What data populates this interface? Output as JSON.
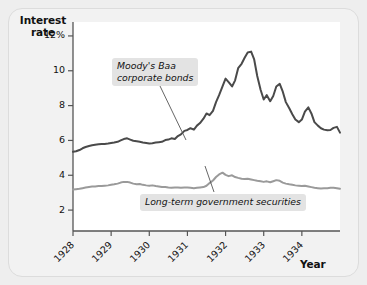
{
  "figure": {
    "background_color": "#f2f2f2",
    "plot_background_color": "#ffffff"
  },
  "axes": {
    "y_title_line1": "Interest",
    "y_title_line2": "rate",
    "x_title": "Year",
    "y_ticks": [
      "12%",
      "10",
      "8",
      "6",
      "4",
      "2"
    ],
    "y_tick_values": [
      12,
      10,
      8,
      6,
      4,
      2
    ],
    "x_ticks": [
      "1928",
      "1929",
      "1930",
      "1931",
      "1932",
      "1933",
      "1934"
    ]
  },
  "annotations": {
    "baa_label_line1": "Moody's Baa",
    "baa_label_line2": "corporate bonds",
    "govt_label": "Long-term government securities"
  },
  "chart_data": {
    "type": "line",
    "title": "",
    "subtitle": "",
    "xlabel": "Year",
    "ylabel": "Interest rate",
    "xlim": [
      1928.0,
      1935.0
    ],
    "ylim": [
      0.8,
      12.8
    ],
    "ytick_values": [
      2,
      4,
      6,
      8,
      10,
      12
    ],
    "ytick_labels": [
      "2",
      "4",
      "6",
      "8",
      "10",
      "12%"
    ],
    "xtick_values": [
      1928,
      1929,
      1930,
      1931,
      1932,
      1933,
      1934
    ],
    "xtick_labels": [
      "1928",
      "1929",
      "1930",
      "1931",
      "1932",
      "1933",
      "1934"
    ],
    "grid": false,
    "legend": "annotations-inline",
    "series": [
      {
        "name": "Moody's Baa corporate bonds",
        "color": "#4a4a4a",
        "linewidth": 2.0,
        "x": [
          1928.0,
          1928.08,
          1928.17,
          1928.25,
          1928.33,
          1928.42,
          1928.5,
          1928.58,
          1928.67,
          1928.75,
          1928.83,
          1928.92,
          1929.0,
          1929.08,
          1929.17,
          1929.25,
          1929.33,
          1929.42,
          1929.5,
          1929.58,
          1929.67,
          1929.75,
          1929.83,
          1929.92,
          1930.0,
          1930.08,
          1930.17,
          1930.25,
          1930.33,
          1930.42,
          1930.5,
          1930.58,
          1930.67,
          1930.75,
          1930.83,
          1930.92,
          1931.0,
          1931.08,
          1931.17,
          1931.25,
          1931.33,
          1931.42,
          1931.5,
          1931.58,
          1931.67,
          1931.75,
          1931.83,
          1931.92,
          1932.0,
          1932.08,
          1932.17,
          1932.25,
          1932.33,
          1932.42,
          1932.5,
          1932.58,
          1932.67,
          1932.75,
          1932.83,
          1932.92,
          1933.0,
          1933.08,
          1933.17,
          1933.25,
          1933.33,
          1933.42,
          1933.5,
          1933.58,
          1933.67,
          1933.75,
          1933.83,
          1933.92,
          1934.0,
          1934.08,
          1934.17,
          1934.25,
          1934.33,
          1934.42,
          1934.5,
          1934.58,
          1934.67,
          1934.75,
          1934.83,
          1934.92,
          1935.0
        ],
        "y": [
          5.35,
          5.38,
          5.45,
          5.55,
          5.62,
          5.68,
          5.72,
          5.75,
          5.78,
          5.8,
          5.8,
          5.82,
          5.85,
          5.88,
          5.92,
          6.0,
          6.08,
          6.12,
          6.05,
          5.98,
          5.95,
          5.92,
          5.88,
          5.85,
          5.82,
          5.84,
          5.88,
          5.9,
          5.92,
          6.02,
          6.05,
          6.12,
          6.08,
          6.25,
          6.35,
          6.55,
          6.6,
          6.7,
          6.62,
          6.85,
          7.0,
          7.25,
          7.55,
          7.45,
          7.7,
          8.2,
          8.6,
          9.1,
          9.55,
          9.35,
          9.1,
          9.45,
          10.15,
          10.4,
          10.75,
          11.05,
          11.1,
          10.65,
          9.7,
          8.9,
          8.35,
          8.6,
          8.25,
          8.55,
          9.1,
          9.25,
          8.8,
          8.2,
          7.85,
          7.5,
          7.2,
          7.05,
          7.2,
          7.65,
          7.9,
          7.55,
          7.05,
          6.85,
          6.7,
          6.62,
          6.58,
          6.6,
          6.72,
          6.78,
          6.45
        ],
        "annotation": "Moody's Baa corporate bonds"
      },
      {
        "name": "Long-term government securities",
        "color": "#9a9a9a",
        "linewidth": 2.0,
        "x": [
          1928.0,
          1928.08,
          1928.17,
          1928.25,
          1928.33,
          1928.42,
          1928.5,
          1928.58,
          1928.67,
          1928.75,
          1928.83,
          1928.92,
          1929.0,
          1929.08,
          1929.17,
          1929.25,
          1929.33,
          1929.42,
          1929.5,
          1929.58,
          1929.67,
          1929.75,
          1929.83,
          1929.92,
          1930.0,
          1930.08,
          1930.17,
          1930.25,
          1930.33,
          1930.42,
          1930.5,
          1930.58,
          1930.67,
          1930.75,
          1930.83,
          1930.92,
          1931.0,
          1931.08,
          1931.17,
          1931.25,
          1931.33,
          1931.42,
          1931.5,
          1931.58,
          1931.67,
          1931.75,
          1931.83,
          1931.92,
          1932.0,
          1932.08,
          1932.17,
          1932.25,
          1932.33,
          1932.42,
          1932.5,
          1932.58,
          1932.67,
          1932.75,
          1932.83,
          1932.92,
          1933.0,
          1933.08,
          1933.17,
          1933.25,
          1933.33,
          1933.42,
          1933.5,
          1933.58,
          1933.67,
          1933.75,
          1933.83,
          1933.92,
          1934.0,
          1934.08,
          1934.17,
          1934.25,
          1934.33,
          1934.42,
          1934.5,
          1934.58,
          1934.67,
          1934.75,
          1934.83,
          1934.92,
          1935.0
        ],
        "y": [
          3.18,
          3.2,
          3.22,
          3.26,
          3.3,
          3.33,
          3.35,
          3.36,
          3.38,
          3.38,
          3.4,
          3.42,
          3.45,
          3.48,
          3.52,
          3.58,
          3.62,
          3.62,
          3.58,
          3.52,
          3.48,
          3.5,
          3.45,
          3.42,
          3.4,
          3.42,
          3.38,
          3.35,
          3.32,
          3.33,
          3.3,
          3.28,
          3.3,
          3.3,
          3.28,
          3.3,
          3.3,
          3.28,
          3.26,
          3.28,
          3.3,
          3.32,
          3.4,
          3.55,
          3.7,
          3.9,
          4.05,
          4.15,
          4.02,
          3.95,
          4.0,
          3.9,
          3.85,
          3.8,
          3.78,
          3.8,
          3.76,
          3.72,
          3.68,
          3.65,
          3.62,
          3.65,
          3.6,
          3.66,
          3.72,
          3.68,
          3.58,
          3.52,
          3.48,
          3.45,
          3.42,
          3.4,
          3.38,
          3.4,
          3.36,
          3.32,
          3.28,
          3.26,
          3.24,
          3.25,
          3.26,
          3.28,
          3.28,
          3.26,
          3.22
        ],
        "annotation": "Long-term government securities"
      }
    ]
  }
}
